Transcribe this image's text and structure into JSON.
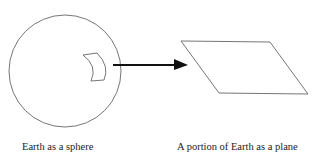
{
  "diagram": {
    "sphere": {
      "label": "Earth as a sphere"
    },
    "plane": {
      "label": "A portion of Earth as a plane"
    },
    "arrow": {
      "direction": "right"
    },
    "colors": {
      "stroke": "#555555",
      "arrow": "#111111",
      "text": "#222222",
      "background": "#ffffff"
    }
  }
}
